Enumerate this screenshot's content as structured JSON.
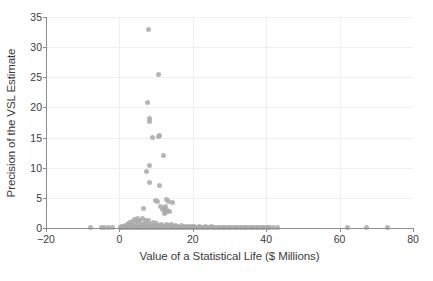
{
  "chart_data": {
    "type": "scatter",
    "title": "",
    "xlabel": "Value of a Statistical Life ($ Millions)",
    "ylabel": "Precision of the VSL Estimate",
    "xlim": [
      -20,
      80
    ],
    "ylim": [
      0,
      35
    ],
    "xticks": [
      -20,
      0,
      20,
      40,
      60,
      80
    ],
    "yticks": [
      0,
      5,
      10,
      15,
      20,
      25,
      30,
      35
    ],
    "grid": true,
    "legend": null,
    "marker_color": "#a9a9a9",
    "axis_color": "#8d8d8d",
    "grid_color": "#f0eef0",
    "background_color": "#ffffff",
    "points": [
      [
        8.0,
        33.0
      ],
      [
        10.6,
        25.4
      ],
      [
        7.6,
        20.8
      ],
      [
        8.2,
        18.1
      ],
      [
        8.2,
        17.7
      ],
      [
        9.1,
        15.0
      ],
      [
        10.9,
        15.3
      ],
      [
        10.7,
        15.1
      ],
      [
        11.9,
        12.1
      ],
      [
        8.3,
        10.3
      ],
      [
        7.3,
        9.3
      ],
      [
        8.1,
        7.5
      ],
      [
        10.8,
        7.0
      ],
      [
        9.9,
        4.6
      ],
      [
        10.3,
        4.4
      ],
      [
        12.9,
        4.8
      ],
      [
        13.3,
        4.4
      ],
      [
        14.6,
        4.2
      ],
      [
        12.6,
        3.6
      ],
      [
        12.2,
        3.2
      ],
      [
        13.0,
        2.9
      ],
      [
        13.6,
        2.7
      ],
      [
        12.5,
        2.6
      ],
      [
        6.6,
        3.3
      ],
      [
        11.8,
        3.1
      ],
      [
        11.2,
        3.5
      ],
      [
        12.4,
        2.4
      ],
      [
        4.2,
        1.4
      ],
      [
        4.9,
        1.5
      ],
      [
        5.6,
        1.3
      ],
      [
        6.3,
        1.5
      ],
      [
        7.0,
        1.2
      ],
      [
        3.6,
        1.1
      ],
      [
        8.0,
        1.3
      ],
      [
        2.8,
        0.9
      ],
      [
        5.2,
        1.0
      ],
      [
        6.8,
        0.8
      ],
      [
        9.4,
        0.9
      ],
      [
        3.1,
        0.6
      ],
      [
        4.4,
        0.7
      ],
      [
        7.7,
        0.6
      ],
      [
        10.2,
        0.7
      ],
      [
        11.5,
        0.6
      ],
      [
        2.2,
        0.5
      ],
      [
        5.9,
        0.5
      ],
      [
        8.6,
        0.5
      ],
      [
        12.8,
        0.5
      ],
      [
        14.2,
        0.5
      ],
      [
        1.6,
        0.4
      ],
      [
        3.4,
        0.4
      ],
      [
        6.1,
        0.4
      ],
      [
        9.0,
        0.4
      ],
      [
        11.0,
        0.4
      ],
      [
        13.5,
        0.4
      ],
      [
        15.4,
        0.4
      ],
      [
        16.8,
        0.4
      ],
      [
        1.1,
        0.3
      ],
      [
        2.6,
        0.3
      ],
      [
        4.7,
        0.3
      ],
      [
        7.2,
        0.3
      ],
      [
        9.8,
        0.3
      ],
      [
        12.1,
        0.3
      ],
      [
        14.9,
        0.3
      ],
      [
        17.6,
        0.3
      ],
      [
        19.1,
        0.3
      ],
      [
        20.5,
        0.3
      ],
      [
        0.6,
        0.2
      ],
      [
        1.9,
        0.2
      ],
      [
        3.3,
        0.2
      ],
      [
        5.0,
        0.2
      ],
      [
        6.5,
        0.2
      ],
      [
        8.4,
        0.2
      ],
      [
        10.4,
        0.2
      ],
      [
        12.3,
        0.2
      ],
      [
        14.0,
        0.2
      ],
      [
        15.9,
        0.2
      ],
      [
        18.2,
        0.2
      ],
      [
        20.0,
        0.2
      ],
      [
        21.8,
        0.2
      ],
      [
        23.4,
        0.2
      ],
      [
        25.1,
        0.2
      ],
      [
        0.3,
        0.12
      ],
      [
        1.4,
        0.12
      ],
      [
        2.3,
        0.12
      ],
      [
        3.8,
        0.12
      ],
      [
        4.6,
        0.12
      ],
      [
        5.5,
        0.12
      ],
      [
        6.9,
        0.12
      ],
      [
        7.9,
        0.12
      ],
      [
        9.2,
        0.12
      ],
      [
        10.1,
        0.12
      ],
      [
        11.3,
        0.12
      ],
      [
        12.6,
        0.12
      ],
      [
        13.8,
        0.12
      ],
      [
        15.0,
        0.12
      ],
      [
        16.3,
        0.12
      ],
      [
        17.4,
        0.12
      ],
      [
        18.8,
        0.12
      ],
      [
        19.9,
        0.12
      ],
      [
        21.2,
        0.12
      ],
      [
        22.6,
        0.12
      ],
      [
        24.0,
        0.12
      ],
      [
        25.7,
        0.12
      ],
      [
        27.0,
        0.12
      ],
      [
        28.5,
        0.12
      ],
      [
        30.1,
        0.12
      ],
      [
        31.6,
        0.12
      ],
      [
        33.0,
        0.12
      ],
      [
        34.4,
        0.12
      ],
      [
        36.0,
        0.12
      ],
      [
        37.5,
        0.12
      ],
      [
        39.0,
        0.12
      ],
      [
        40.6,
        0.12
      ],
      [
        -8.0,
        0.05
      ],
      [
        -5.0,
        0.05
      ],
      [
        -4.0,
        0.05
      ],
      [
        -3.1,
        0.05
      ],
      [
        -2.0,
        0.05
      ],
      [
        0.2,
        0.05
      ],
      [
        0.9,
        0.05
      ],
      [
        1.7,
        0.05
      ],
      [
        2.5,
        0.05
      ],
      [
        3.2,
        0.05
      ],
      [
        4.0,
        0.05
      ],
      [
        4.8,
        0.05
      ],
      [
        5.4,
        0.05
      ],
      [
        6.2,
        0.05
      ],
      [
        7.1,
        0.05
      ],
      [
        7.8,
        0.05
      ],
      [
        8.5,
        0.05
      ],
      [
        9.3,
        0.05
      ],
      [
        10.0,
        0.05
      ],
      [
        10.8,
        0.05
      ],
      [
        11.6,
        0.05
      ],
      [
        12.4,
        0.05
      ],
      [
        13.2,
        0.05
      ],
      [
        14.1,
        0.05
      ],
      [
        14.8,
        0.05
      ],
      [
        15.6,
        0.05
      ],
      [
        16.5,
        0.05
      ],
      [
        17.2,
        0.05
      ],
      [
        18.0,
        0.05
      ],
      [
        18.9,
        0.05
      ],
      [
        19.6,
        0.05
      ],
      [
        20.4,
        0.05
      ],
      [
        21.3,
        0.05
      ],
      [
        22.1,
        0.05
      ],
      [
        23.0,
        0.05
      ],
      [
        23.8,
        0.05
      ],
      [
        24.6,
        0.05
      ],
      [
        25.5,
        0.05
      ],
      [
        26.3,
        0.05
      ],
      [
        27.2,
        0.05
      ],
      [
        28.0,
        0.05
      ],
      [
        28.9,
        0.05
      ],
      [
        29.7,
        0.05
      ],
      [
        30.6,
        0.05
      ],
      [
        31.4,
        0.05
      ],
      [
        32.3,
        0.05
      ],
      [
        33.2,
        0.05
      ],
      [
        34.0,
        0.05
      ],
      [
        34.9,
        0.05
      ],
      [
        35.8,
        0.05
      ],
      [
        36.6,
        0.05
      ],
      [
        37.4,
        0.05
      ],
      [
        38.3,
        0.05
      ],
      [
        39.2,
        0.05
      ],
      [
        40.0,
        0.05
      ],
      [
        41.0,
        0.05
      ],
      [
        41.9,
        0.05
      ],
      [
        43.2,
        0.05
      ],
      [
        62.2,
        0.05
      ],
      [
        67.3,
        0.05
      ],
      [
        73.1,
        0.05
      ]
    ]
  }
}
